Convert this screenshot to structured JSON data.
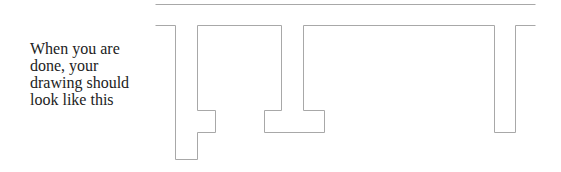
{
  "caption": {
    "lines": [
      "When you are",
      "done, your",
      "drawing should",
      "look like this"
    ]
  },
  "drawing": {
    "stroke_color": "#a8a8a8",
    "top_line": {
      "x1": 155,
      "y1": 4,
      "x2": 535,
      "y2": 4
    },
    "paths": [
      {
        "name": "left-shape",
        "points": "155,25 175,25 175,159 197,159 197,132 215,132 215,110 197,110 197,25 281,25 281,110 264,110 264,132 324,132 324,110 303,110 303,25 494,25 494,132 515,132 515,25 535,25"
      }
    ]
  }
}
